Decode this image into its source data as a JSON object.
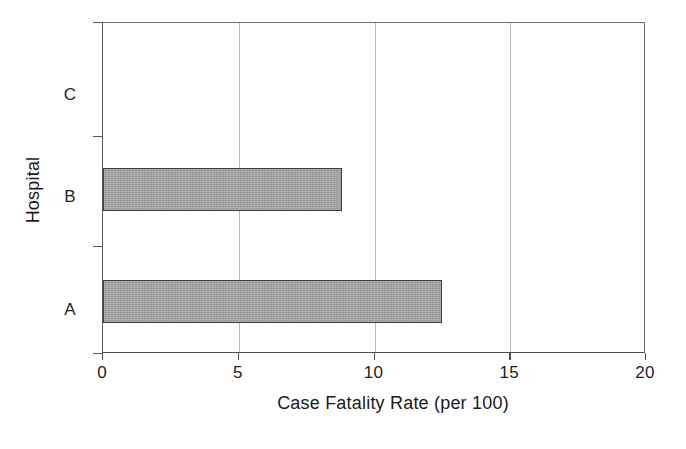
{
  "chart_data": {
    "type": "bar",
    "orientation": "horizontal",
    "title": "",
    "xlabel": "Case Fatality Rate (per 100)",
    "ylabel": "Hospital",
    "categories": [
      "A",
      "B",
      "C"
    ],
    "values": [
      12.5,
      8.8,
      0
    ],
    "series": [
      {
        "name": "Case Fatality Rate (per 100)",
        "values": [
          12.5,
          8.8,
          0
        ]
      }
    ],
    "xlim": [
      0,
      20
    ],
    "xticks": [
      0,
      5,
      10,
      15,
      20
    ],
    "xtick_labels": [
      "0",
      "5",
      "10",
      "15",
      "20"
    ],
    "ytick_labels": [
      "C",
      "B",
      "A"
    ],
    "grid": "vertical",
    "legend": "none",
    "bar_fill_color": "#a8a8a8",
    "bar_edge_color": "#3d3d3d",
    "gridline_color": "#b9b9b9",
    "axis_color": "#4d4d4d",
    "background_color": "#ffffff"
  },
  "bars": [
    {
      "category": "C",
      "value": 0,
      "value_label": "0"
    },
    {
      "category": "B",
      "value": 8.8,
      "value_label": "8.8"
    },
    {
      "category": "A",
      "value": 12.5,
      "value_label": "12.5"
    }
  ],
  "axes": {
    "x": {
      "title": "Case Fatality Rate (per 100)",
      "ticks": [
        {
          "value": 0,
          "label": "0"
        },
        {
          "value": 5,
          "label": "5"
        },
        {
          "value": 10,
          "label": "10"
        },
        {
          "value": 15,
          "label": "15"
        },
        {
          "value": 20,
          "label": "20"
        }
      ]
    },
    "y": {
      "title": "Hospital",
      "ticks": [
        {
          "label": "C"
        },
        {
          "label": "B"
        },
        {
          "label": "A"
        }
      ]
    }
  }
}
